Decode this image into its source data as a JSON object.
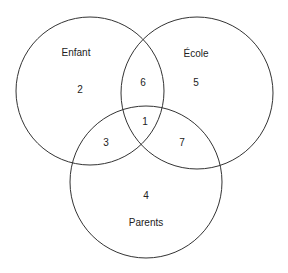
{
  "diagram": {
    "type": "venn",
    "sets": [
      {
        "id": "enfant",
        "label": "Enfant",
        "cx": 90,
        "cy": 91,
        "r": 74
      },
      {
        "id": "ecole",
        "label": "École",
        "cx": 197,
        "cy": 93,
        "r": 76
      },
      {
        "id": "parents",
        "label": "Parents",
        "cx": 146,
        "cy": 182,
        "r": 76
      }
    ],
    "regions": [
      {
        "id": "r1",
        "label": "1",
        "sets": [
          "enfant",
          "ecole",
          "parents"
        ]
      },
      {
        "id": "r2",
        "label": "2",
        "sets": [
          "enfant"
        ]
      },
      {
        "id": "r3",
        "label": "3",
        "sets": [
          "enfant",
          "parents"
        ]
      },
      {
        "id": "r4",
        "label": "4",
        "sets": [
          "parents"
        ]
      },
      {
        "id": "r5",
        "label": "5",
        "sets": [
          "ecole"
        ]
      },
      {
        "id": "r6",
        "label": "6",
        "sets": [
          "enfant",
          "ecole"
        ]
      },
      {
        "id": "r7",
        "label": "7",
        "sets": [
          "ecole",
          "parents"
        ]
      }
    ],
    "stroke_color": "#333333"
  }
}
